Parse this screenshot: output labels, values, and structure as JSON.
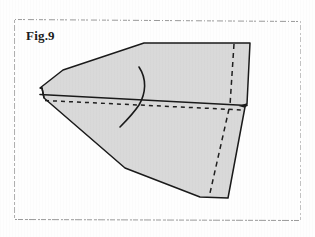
{
  "figure": {
    "label": "Fig.9",
    "caption_position": "top-left",
    "canvas": {
      "width": 315,
      "height": 237
    },
    "background_color": "#fefefe",
    "ink_color": "#1c1c1c",
    "shape_fill_color": "#d8d8d8",
    "shape_stroke_color": "#1a1a1a",
    "border_color": "#9a9a9a"
  },
  "border": {
    "name": "scanned-page-border",
    "left_x": 14,
    "right_x": 301,
    "top_y": 19,
    "bottom_y": 220,
    "style": "broken-dotted"
  },
  "shape": {
    "name": "folded-paper-polygon",
    "description": "Shaded quadrilateral-like folded sheet seen in perspective",
    "outline_points": "144,43 250,43 247,104 245,107 228,198 200,197 125,168 44,98 42,88 40,88 63,70",
    "upper_panel_points": "144,43 250,43 247,104 43,96 40,88 63,70",
    "lower_panel_points": "43,99 245,107 228,198 200,197 125,168 44,99",
    "fold_line": {
      "name": "horizontal-fold-solid",
      "points": "41,95 246,106"
    },
    "fold_line_dashed": {
      "name": "horizontal-fold-dashed",
      "points": "44,100 244,110"
    },
    "vertical_dashed_upper": {
      "name": "vertical-fold-dashed-upper",
      "points": "234,44 230,105"
    },
    "vertical_dashed_lower": {
      "name": "vertical-fold-dashed-lower",
      "points": "229,108 210,192"
    },
    "fold_arc": {
      "name": "fold-direction-arc",
      "path": "M 139,67 C 146,78 146,92 139,104 C 133,113 126,120 120,126"
    }
  }
}
